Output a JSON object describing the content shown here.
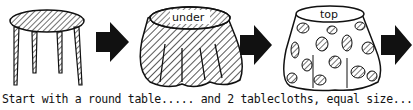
{
  "diagram": {
    "steps": [
      {
        "id": "table",
        "description": "round table",
        "label": ""
      },
      {
        "id": "under-cloth",
        "description": "striped tablecloth on table",
        "label": "under"
      },
      {
        "id": "top-cloth",
        "description": "leaf-patterned tablecloth on table",
        "label": "top"
      }
    ],
    "arrows": 3,
    "caption": "Start with a round table..... and 2 tablecloths,  equal size..."
  }
}
